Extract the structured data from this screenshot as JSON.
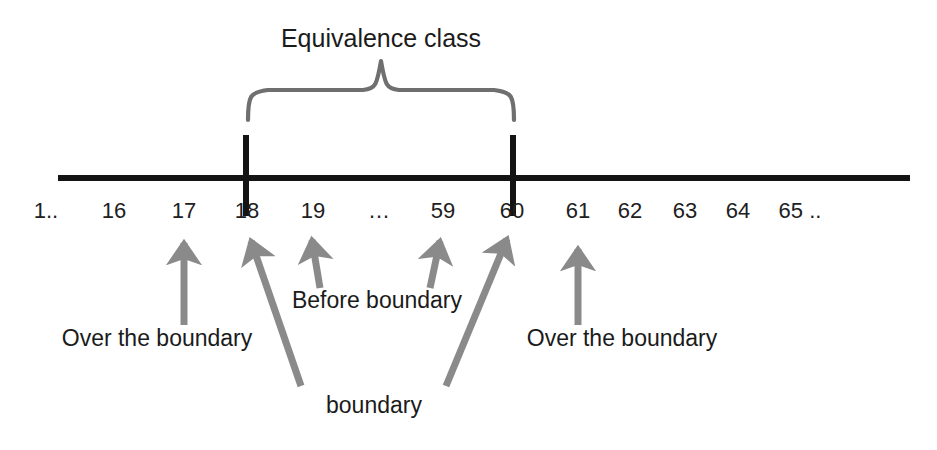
{
  "diagram": {
    "title": "Equivalence class",
    "colors": {
      "axis": "#141414",
      "tick": "#141414",
      "brace": "#6f6f6f",
      "arrow": "#8a8a8a",
      "text": "#1b1b1b",
      "background": "#ffffff"
    },
    "axis": {
      "name": "number-line",
      "labels": [
        {
          "text": "1..",
          "x": 46
        },
        {
          "text": "16",
          "x": 114
        },
        {
          "text": "17",
          "x": 184
        },
        {
          "text": "18",
          "x": 247
        },
        {
          "text": "19",
          "x": 313
        },
        {
          "text": "…",
          "x": 379
        },
        {
          "text": "59",
          "x": 443
        },
        {
          "text": "60",
          "x": 512
        },
        {
          "text": "61",
          "x": 578
        },
        {
          "text": "62",
          "x": 630
        },
        {
          "text": "63",
          "x": 685
        },
        {
          "text": "64",
          "x": 738
        },
        {
          "text": "65 ..",
          "x": 800
        }
      ],
      "ticks": [
        {
          "label": "18",
          "x": 246
        },
        {
          "label": "60",
          "x": 513
        }
      ]
    },
    "brace": {
      "label": "Equivalence class",
      "left_x": 248,
      "right_x": 514
    },
    "annotations": [
      {
        "id": "over-the-boundary-left",
        "text": "Over the boundary",
        "x": 157,
        "y": 338,
        "points_to": "17"
      },
      {
        "id": "before-boundary",
        "text": "Before boundary",
        "x": 377,
        "y": 300,
        "points_to": "19 and 59"
      },
      {
        "id": "boundary",
        "text": "boundary",
        "x": 374,
        "y": 405,
        "points_to": "18 and 60"
      },
      {
        "id": "over-the-boundary-right",
        "text": "Over the boundary",
        "x": 622,
        "y": 338,
        "points_to": "61"
      }
    ],
    "arrows": [
      {
        "id": "arrow-to-17",
        "tip_x": 184,
        "tip_y": 236,
        "tail_x": 184,
        "tail_y": 325
      },
      {
        "id": "arrow-to-18",
        "tip_x": 249,
        "tip_y": 234,
        "tail_x": 301,
        "tail_y": 386
      },
      {
        "id": "arrow-to-19",
        "tip_x": 311,
        "tip_y": 232,
        "tail_x": 320,
        "tail_y": 288
      },
      {
        "id": "arrow-to-59",
        "tip_x": 441,
        "tip_y": 233,
        "tail_x": 430,
        "tail_y": 288
      },
      {
        "id": "arrow-to-60",
        "tip_x": 509,
        "tip_y": 231,
        "tail_x": 446,
        "tail_y": 386
      },
      {
        "id": "arrow-to-61",
        "tip_x": 578,
        "tip_y": 242,
        "tail_x": 578,
        "tail_y": 325
      }
    ]
  }
}
